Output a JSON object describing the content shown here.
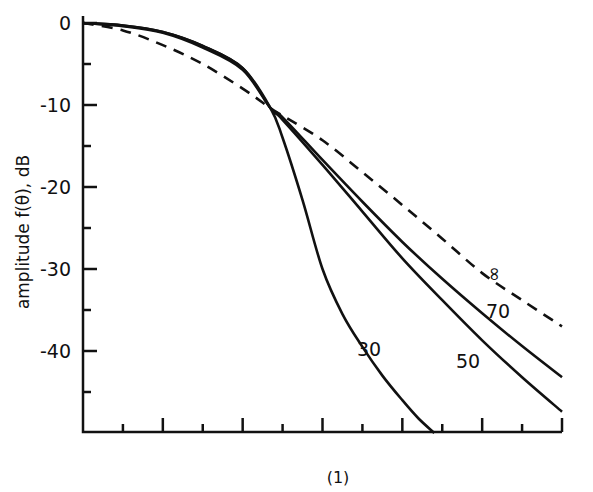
{
  "chart_data": {
    "type": "line",
    "title": "",
    "caption": "(1)",
    "xlabel": "",
    "ylabel": "amplitude f(θ), dB",
    "ylim": [
      -50,
      0
    ],
    "xlim": [
      0,
      12
    ],
    "x_ticks_note": "12 unlabeled intervals; major ticks every 2",
    "y_ticks": [
      0,
      -10,
      -20,
      -30,
      -40
    ],
    "y_tick_labels": [
      "0",
      "-10",
      "-20",
      "-30",
      "-40"
    ],
    "grid": false,
    "legend": "inline curve labels",
    "series": [
      {
        "name": "∞",
        "style": "dashed",
        "x": [
          0,
          1,
          2,
          3,
          4,
          4.7,
          5,
          6,
          7,
          8,
          9,
          10,
          11,
          12
        ],
        "y": [
          0,
          -0.9,
          -2.7,
          -5.0,
          -8.0,
          -10.4,
          -11.3,
          -14.3,
          -18.2,
          -22.2,
          -26.3,
          -30.5,
          -33.8,
          -37
        ]
      },
      {
        "name": "70",
        "style": "solid",
        "x": [
          0,
          1,
          2,
          3,
          4,
          4.7,
          5,
          6,
          7,
          8,
          9,
          10,
          11,
          12
        ],
        "y": [
          0,
          -0.4,
          -1.2,
          -3.0,
          -5.7,
          -10.4,
          -11.5,
          -16.7,
          -21.8,
          -26.7,
          -31.2,
          -35.4,
          -39.4,
          -43.2
        ]
      },
      {
        "name": "50",
        "style": "solid",
        "x": [
          0,
          1,
          2,
          3,
          4,
          4.7,
          5,
          6,
          7,
          8,
          9,
          10,
          11,
          12
        ],
        "y": [
          0,
          -0.3,
          -1.1,
          -2.8,
          -5.5,
          -10.4,
          -11.8,
          -17.3,
          -23.0,
          -28.7,
          -33.8,
          -38.7,
          -43.2,
          -47.4
        ]
      },
      {
        "name": "30",
        "style": "solid",
        "x": [
          0,
          1,
          2,
          3,
          4,
          4.7,
          5,
          5.5,
          6,
          6.5,
          7,
          7.5,
          8,
          8.4,
          8.8
        ],
        "y": [
          0,
          -0.3,
          -1.1,
          -2.8,
          -5.5,
          -10.4,
          -14.0,
          -21.6,
          -30.0,
          -35.5,
          -39.5,
          -43.0,
          -46.0,
          -48.2,
          -50
        ]
      }
    ]
  }
}
